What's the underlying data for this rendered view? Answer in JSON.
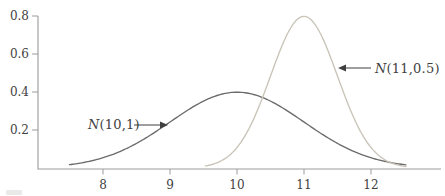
{
  "figure": {
    "background": "#ffffff"
  },
  "chart_data": {
    "type": "line",
    "title": "",
    "xlabel": "",
    "ylabel": "",
    "grid": false,
    "xlim": [
      7.03,
      13.04
    ],
    "ylim": [
      0,
      0.82
    ],
    "x_tick_values": [
      8,
      9,
      10,
      11,
      12
    ],
    "x_tick_labels": [
      "8",
      "9",
      "10",
      "11",
      "12"
    ],
    "y_tick_values": [
      0.2,
      0.4,
      0.6,
      0.8
    ],
    "y_tick_labels": [
      "0.2",
      "0.4",
      "0.6",
      "0.8"
    ],
    "axis_color": "#9b9b9b",
    "tick_label_color": "#3f3f3f",
    "series": [
      {
        "name": "N(10,1)",
        "distribution": "normal",
        "mean": 10,
        "sd": 1,
        "x_start": 7.5,
        "x_end": 12.52,
        "peak_value": 0.399,
        "color": "#6b6b6b"
      },
      {
        "name": "N(11,0.5)",
        "distribution": "normal",
        "mean": 11,
        "sd": 0.5,
        "x_start": 9.53,
        "x_end": 12.52,
        "peak_value": 0.798,
        "color": "#c8c4b7"
      }
    ],
    "annotations": [
      {
        "label_symbol": "N",
        "label_args": "(10,1)",
        "target_series": "N(10,1)",
        "arrow_direction": "right"
      },
      {
        "label_symbol": "N",
        "label_args": "(11,0.5)",
        "target_series": "N(11,0.5)",
        "arrow_direction": "left"
      }
    ],
    "annotation_color": "#3f3f3f"
  }
}
